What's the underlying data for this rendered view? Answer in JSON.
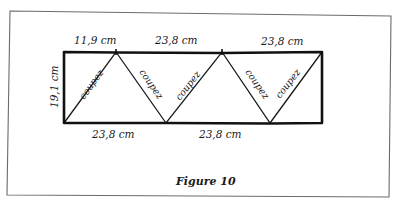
{
  "figure": {
    "caption": "Figure 10",
    "colors": {
      "frame": "#6b6b6b",
      "outline": "#111111",
      "cut_line": "#1a1a1a",
      "background": "#ffffff"
    },
    "dimensions": {
      "height_left": "19,1 cm",
      "top_first_segment": "11,9 cm",
      "top_second_segment": "23,8 cm",
      "top_third_segment": "23,8 cm",
      "bottom_first_segment": "23,8 cm",
      "bottom_second_segment": "23,8 cm"
    },
    "cut_labels": [
      "coupez",
      "coupez",
      "coupez",
      "coupez",
      "coupez"
    ]
  }
}
